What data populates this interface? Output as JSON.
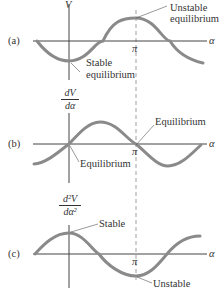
{
  "figure": {
    "panels": [
      {
        "tag": "(a)",
        "ylabel": "V",
        "xlabel": "α",
        "pi_label": "π",
        "annotations": [
          {
            "text_line1": "Unstable",
            "text_line2": "equilibrium"
          },
          {
            "text_line1": "Stable",
            "text_line2": "equilibrium"
          }
        ],
        "curve": "-cos(α)"
      },
      {
        "tag": "(b)",
        "ylabel_num": "dV",
        "ylabel_den": "dα",
        "xlabel": "α",
        "pi_label": "π",
        "annotations": [
          {
            "text_line1": "Equilibrium"
          },
          {
            "text_line1": "Equilibrium"
          }
        ],
        "curve": "sin(α)"
      },
      {
        "tag": "(c)",
        "ylabel_num": "d²V",
        "ylabel_den": "dα²",
        "xlabel": "α",
        "pi_label": "π",
        "annotations": [
          {
            "text_line1": "Stable"
          },
          {
            "text_line1": "Unstable"
          }
        ],
        "curve": "cos(α)"
      }
    ],
    "colors": {
      "curve": "#8a8a8a",
      "axis": "#444444",
      "dashed": "#777777",
      "text": "#333333"
    }
  }
}
